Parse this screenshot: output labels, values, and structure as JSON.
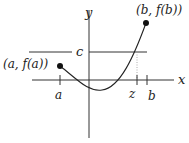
{
  "diagram": {
    "axes": {
      "x_label": "x",
      "y_label": "y"
    },
    "horizontal_line": {
      "label": "c"
    },
    "points": [
      {
        "id": "a-point",
        "label": "(a, f(a))"
      },
      {
        "id": "b-point",
        "label": "(b, f(b))"
      }
    ],
    "ticks": [
      {
        "id": "a-tick",
        "label": "a"
      },
      {
        "id": "z-tick",
        "label": "z"
      },
      {
        "id": "b-tick",
        "label": "b"
      }
    ],
    "colors": {
      "stroke": "#222222",
      "dotted": "#999999",
      "background": "#ffffff"
    }
  }
}
